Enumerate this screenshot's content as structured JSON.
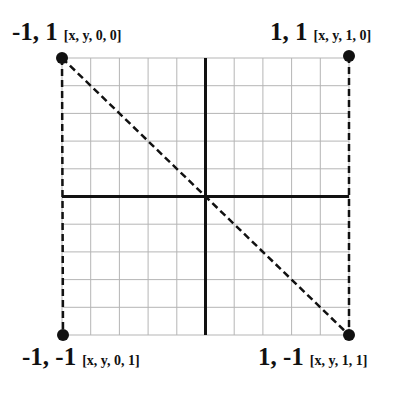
{
  "diagram": {
    "type": "coordinate-grid",
    "grid": {
      "divisions": 10,
      "left": 62,
      "top": 58,
      "right": 349,
      "bottom": 335,
      "grid_color": "#b5b5b5",
      "axis_color": "#111111"
    },
    "corners": [
      {
        "id": "top-left",
        "coord": "-1, 1",
        "tuple": "[x, y, 0, 0]",
        "x": 62,
        "y": 58
      },
      {
        "id": "top-right",
        "coord": "1, 1",
        "tuple": "[x, y, 1, 0]",
        "x": 349,
        "y": 56
      },
      {
        "id": "bottom-left",
        "coord": "-1, -1",
        "tuple": "[x, y, 0, 1]",
        "x": 63,
        "y": 335
      },
      {
        "id": "bottom-right",
        "coord": "1, -1",
        "tuple": "[x, y, 1, 1]",
        "x": 349,
        "y": 335
      }
    ],
    "dashed_lines": [
      "left-edge",
      "right-edge",
      "diagonal-top-left-to-bottom-right"
    ]
  }
}
